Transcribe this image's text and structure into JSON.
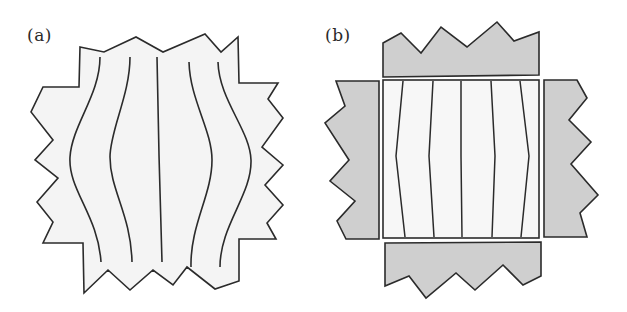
{
  "figure": {
    "panels": [
      {
        "label": "(a)",
        "description": "Single deformed block with jagged boundary; five internal vertical lines, outer lines curved outward (barrel-shaped deformation)",
        "fill_color": "#f4f4f4",
        "stroke_color": "#2b2b2b",
        "line_count": 5
      },
      {
        "label": "(b)",
        "description": "Central rectangular block with five nearly straight vertical lines, surrounded by four separated gray jagged blocks (top, bottom, left, right)",
        "center_fill_color": "#f7f7f7",
        "surround_fill_color": "#cfcfcf",
        "stroke_color": "#2b2b2b",
        "line_count": 5,
        "surrounding_blocks": [
          "top",
          "left",
          "right",
          "bottom"
        ]
      }
    ]
  }
}
